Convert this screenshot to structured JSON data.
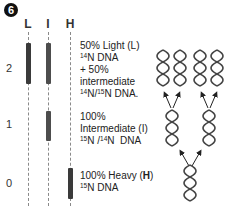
{
  "figure": {
    "panel_number": "6",
    "columns": [
      {
        "key": "L",
        "label": "L"
      },
      {
        "key": "I",
        "label": "I"
      },
      {
        "key": "H",
        "label": "H"
      }
    ],
    "generations": [
      {
        "label": "2",
        "bands": [
          "L",
          "I"
        ],
        "description": {
          "line1": "50% Light (L)",
          "line2_sup": "14",
          "line2": "N DNA",
          "line3": "+ 50%",
          "line4": "intermediate",
          "line5_sup1": "14",
          "line5_mid": "N/",
          "line5_sup2": "15",
          "line5_end": "N DNA."
        }
      },
      {
        "label": "1",
        "bands": [
          "I"
        ],
        "description": {
          "line1": "100%",
          "line2": "Intermediate (I)",
          "line3_sup1": "15",
          "line3_mid": "N /",
          "line3_sup2": "14",
          "line3_end": "N  DNA"
        }
      },
      {
        "label": "0",
        "bands": [
          "H"
        ],
        "description": {
          "line1": "100% Heavy (",
          "line1_bold": "H",
          "line1_end": ")",
          "line2_sup": "15",
          "line2": "N DNA"
        }
      }
    ],
    "replication_diagram": {
      "generation_0_helices": 1,
      "generation_1_helices": 2,
      "generation_2_helices": 4,
      "arrow_color": "#222222",
      "helix_color": "#444444"
    },
    "colors": {
      "band": "#3a3a3a",
      "lane_line": "#8a8a8a",
      "badge_bg": "#111111",
      "badge_text": "#ffffff"
    }
  }
}
